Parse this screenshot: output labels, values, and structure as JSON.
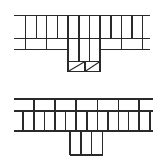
{
  "canvas": {
    "width": 165,
    "height": 164,
    "background": "#ffffff",
    "stroke": "#2a2a2a"
  },
  "figures": [
    {
      "name": "top-stair-plan",
      "horizontal_lines": [
        {
          "y": 15.5,
          "x1": 14,
          "x2": 150
        },
        {
          "y": 38.5,
          "x1": 14,
          "x2": 150
        },
        {
          "y": 49.5,
          "x1": 14,
          "x2": 68
        },
        {
          "y": 49.5,
          "x1": 100,
          "x2": 150
        }
      ],
      "vertical_lines": [
        {
          "x": 25.5,
          "y1": 15.5,
          "y2": 49.5
        },
        {
          "x": 36.5,
          "y1": 15.5,
          "y2": 38.5
        },
        {
          "x": 46.5,
          "y1": 15.5,
          "y2": 49.5
        },
        {
          "x": 57.5,
          "y1": 15.5,
          "y2": 38.5
        },
        {
          "x": 68,
          "y1": 15.5,
          "y2": 61.5
        },
        {
          "x": 79,
          "y1": 15.5,
          "y2": 61.5
        },
        {
          "x": 89.5,
          "y1": 15.5,
          "y2": 61.5
        },
        {
          "x": 100,
          "y1": 15.5,
          "y2": 61.5
        },
        {
          "x": 111,
          "y1": 15.5,
          "y2": 38.5
        },
        {
          "x": 121.5,
          "y1": 15.5,
          "y2": 49.5
        },
        {
          "x": 132,
          "y1": 15.5,
          "y2": 38.5
        },
        {
          "x": 142.5,
          "y1": 15.5,
          "y2": 49.5
        }
      ],
      "rects": [
        {
          "x": 68,
          "y": 61.5,
          "w": 32,
          "h": 10
        }
      ],
      "extra_verticals": [
        {
          "x": 85,
          "y1": 61.5,
          "y2": 71.5
        }
      ],
      "diagonals": [
        {
          "x1": 68,
          "y1": 71.5,
          "x2": 85,
          "y2": 61.5
        },
        {
          "x1": 85,
          "y1": 71.5,
          "x2": 100,
          "y2": 61.5
        }
      ]
    },
    {
      "name": "bottom-stair-plan",
      "horizontal_lines": [
        {
          "y": 99,
          "x1": 14,
          "x2": 153
        },
        {
          "y": 111,
          "x1": 14,
          "x2": 153
        },
        {
          "y": 131,
          "x1": 14,
          "x2": 153
        },
        {
          "y": 155,
          "x1": 70,
          "x2": 102.5
        }
      ],
      "vertical_lines": [
        {
          "x": 34,
          "y1": 99,
          "y2": 111
        },
        {
          "x": 55,
          "y1": 99,
          "y2": 111
        },
        {
          "x": 76,
          "y1": 99,
          "y2": 111
        },
        {
          "x": 97.5,
          "y1": 99,
          "y2": 111
        },
        {
          "x": 118.5,
          "y1": 99,
          "y2": 111
        },
        {
          "x": 139,
          "y1": 99,
          "y2": 111
        },
        {
          "x": 23,
          "y1": 111,
          "y2": 131
        },
        {
          "x": 34,
          "y1": 111,
          "y2": 131
        },
        {
          "x": 44.5,
          "y1": 111,
          "y2": 131
        },
        {
          "x": 55,
          "y1": 111,
          "y2": 131
        },
        {
          "x": 65.5,
          "y1": 111,
          "y2": 131
        },
        {
          "x": 76,
          "y1": 111,
          "y2": 131
        },
        {
          "x": 87,
          "y1": 111,
          "y2": 131
        },
        {
          "x": 97.5,
          "y1": 111,
          "y2": 131
        },
        {
          "x": 108,
          "y1": 111,
          "y2": 131
        },
        {
          "x": 118.5,
          "y1": 111,
          "y2": 131
        },
        {
          "x": 128.5,
          "y1": 111,
          "y2": 131
        },
        {
          "x": 139,
          "y1": 111,
          "y2": 131
        },
        {
          "x": 150,
          "y1": 111,
          "y2": 131
        },
        {
          "x": 70,
          "y1": 131,
          "y2": 155
        },
        {
          "x": 81,
          "y1": 131,
          "y2": 155
        },
        {
          "x": 91.5,
          "y1": 131,
          "y2": 155
        },
        {
          "x": 102.5,
          "y1": 131,
          "y2": 155
        }
      ],
      "rects": [],
      "extra_verticals": [],
      "diagonals": []
    }
  ]
}
